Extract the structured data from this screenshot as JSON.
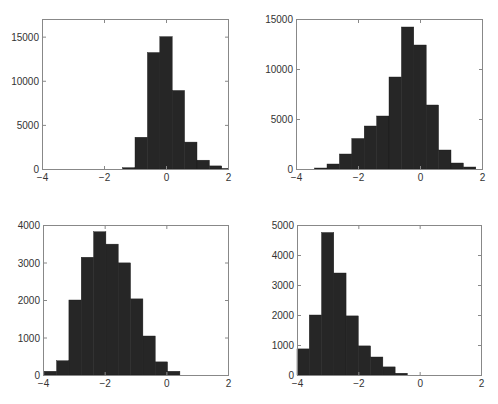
{
  "figure": {
    "bar_color": "#262626",
    "axis_color": "#888888",
    "tick_label_color": "#333333"
  },
  "chart_data": [
    {
      "type": "bar",
      "panel": "top-left",
      "title": "",
      "xlabel": "",
      "ylabel": "",
      "xlim": [
        -4,
        2
      ],
      "ylim": [
        0,
        17000
      ],
      "xticks": [
        -4,
        -2,
        0,
        2
      ],
      "xtick_labels": [
        "−4",
        "−2",
        "0",
        "2"
      ],
      "yticks": [
        0,
        5000,
        10000,
        15000
      ],
      "ytick_labels": [
        "0",
        "5000",
        "10000",
        "15000"
      ],
      "bin_width": 0.4,
      "bin_edges_start": -1.4,
      "values": [
        150,
        3600,
        13200,
        15000,
        8900,
        3050,
        1000,
        350,
        50
      ],
      "grid": false
    },
    {
      "type": "bar",
      "panel": "top-right",
      "title": "",
      "xlabel": "",
      "ylabel": "",
      "xlim": [
        -4,
        2
      ],
      "ylim": [
        0,
        15000
      ],
      "xticks": [
        -4,
        -2,
        0,
        2
      ],
      "xtick_labels": [
        "−4",
        "−2",
        "0",
        "2"
      ],
      "yticks": [
        0,
        5000,
        10000,
        15000
      ],
      "ytick_labels": [
        "0",
        "5000",
        "10000",
        "15000"
      ],
      "bin_width": 0.4,
      "bin_edges_start": -3.4,
      "values": [
        100,
        500,
        1500,
        3050,
        4300,
        5300,
        9200,
        14200,
        12400,
        6400,
        1900,
        600,
        200
      ],
      "grid": false
    },
    {
      "type": "bar",
      "panel": "bottom-left",
      "title": "",
      "xlabel": "",
      "ylabel": "",
      "xlim": [
        -4,
        2
      ],
      "ylim": [
        0,
        4000
      ],
      "xticks": [
        -4,
        -2,
        0,
        2
      ],
      "xtick_labels": [
        "−4",
        "−2",
        "0",
        "2"
      ],
      "yticks": [
        0,
        1000,
        2000,
        3000,
        4000
      ],
      "ytick_labels": [
        "0",
        "1000",
        "2000",
        "3000",
        "4000"
      ],
      "bin_width": 0.4,
      "bin_edges_start": -3.96,
      "values": [
        100,
        380,
        2000,
        3140,
        3820,
        3490,
        2990,
        2030,
        1040,
        350,
        100
      ],
      "grid": false
    },
    {
      "type": "bar",
      "panel": "bottom-right",
      "title": "",
      "xlabel": "",
      "ylabel": "",
      "xlim": [
        -4,
        2
      ],
      "ylim": [
        0,
        5000
      ],
      "xticks": [
        -4,
        -2,
        0,
        2
      ],
      "xtick_labels": [
        "−4",
        "−2",
        "0",
        "2"
      ],
      "yticks": [
        0,
        1000,
        2000,
        3000,
        4000,
        5000
      ],
      "ytick_labels": [
        "0",
        "1000",
        "2000",
        "3000",
        "4000",
        "5000"
      ],
      "bin_width": 0.4,
      "bin_edges_start": -4.0,
      "values": [
        870,
        2000,
        4750,
        3400,
        1970,
        970,
        600,
        270,
        60
      ],
      "grid": false
    }
  ]
}
